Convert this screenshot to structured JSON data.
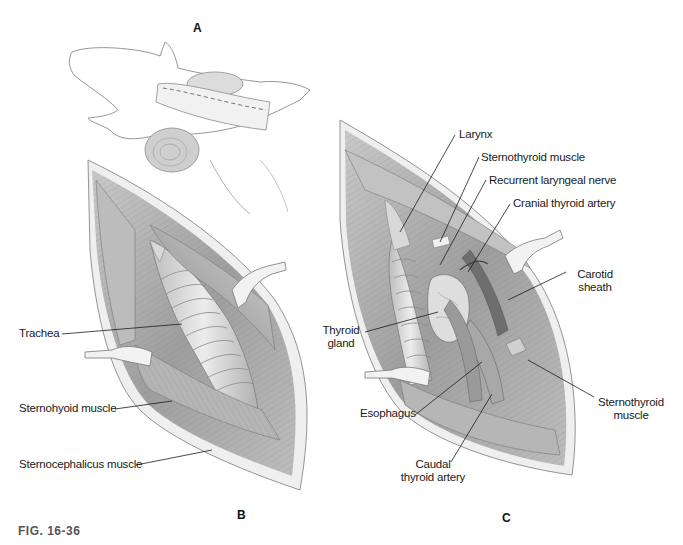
{
  "figure": {
    "caption": "FIG. 16-36",
    "panels": [
      {
        "id": "A",
        "letter": "A",
        "description": "Dog in dorsal recumbency with neck elevated on rolled towel; dashed incision line on ventral midline of neck"
      },
      {
        "id": "B",
        "letter": "B",
        "description": "Ventral cervical approach exposing trachea between retracted sternohyoid muscles"
      },
      {
        "id": "C",
        "letter": "C",
        "description": "Deeper exposure showing thyroid gland and associated structures"
      }
    ],
    "panel_b_labels": [
      {
        "text": "Trachea"
      },
      {
        "text": "Sternohyoid muscle"
      },
      {
        "text": "Sternocephalicus muscle"
      }
    ],
    "panel_c_labels": [
      {
        "text": "Larynx"
      },
      {
        "text": "Sternothyroid muscle"
      },
      {
        "text": "Recurrent laryngeal nerve"
      },
      {
        "text": "Cranial thyroid artery"
      },
      {
        "text_line1": "Carotid",
        "text_line2": "sheath"
      },
      {
        "text_line1": "Thyroid",
        "text_line2": "gland"
      },
      {
        "text": "Esophagus"
      },
      {
        "text_line1": "Sternothyroid",
        "text_line2": "muscle"
      },
      {
        "text_line1": "Caudal",
        "text_line2": "thyroid artery"
      }
    ],
    "colors": {
      "background": "#ffffff",
      "muscle_fill": "#b8b8b8",
      "muscle_dark": "#7a7a7a",
      "skin_edge": "#e8e8e8",
      "trachea": "#d9d9d9",
      "retractor": "#efefef",
      "outline": "#555555",
      "caption": "#555555"
    }
  }
}
